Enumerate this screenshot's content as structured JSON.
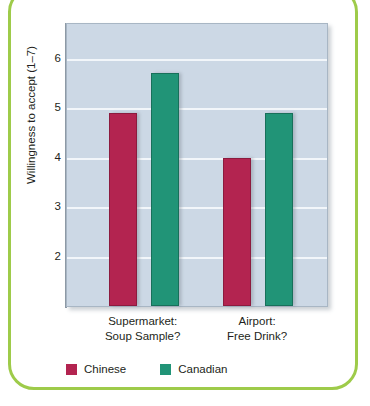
{
  "figure": {
    "frame_color": "#9ecb4a",
    "plot_background": "#ccd8e5",
    "gridline_color": "#f2f6fa"
  },
  "chart_data": {
    "type": "bar",
    "title": "",
    "xlabel": "",
    "ylabel": "Willingness to accept (1–7)",
    "categories": [
      "Supermarket:\nSoup Sample?",
      "Airport:\nFree Drink?"
    ],
    "category_lines": [
      [
        "Supermarket:",
        "Soup Sample?"
      ],
      [
        "Airport:",
        "Free Drink?"
      ]
    ],
    "series": [
      {
        "name": "Chinese",
        "color": "#b32450",
        "values": [
          4.9,
          4.0
        ]
      },
      {
        "name": "Canadian",
        "color": "#219477",
        "values": [
          5.7,
          4.9
        ]
      }
    ],
    "ylim": [
      1,
      6.7
    ],
    "yticks": [
      2,
      3,
      4,
      5,
      6
    ],
    "ytick_labels": [
      "2",
      "3",
      "4",
      "5",
      "6"
    ],
    "grid": true,
    "legend_position": "bottom-left"
  },
  "legend": {
    "entries": [
      {
        "label": "Chinese",
        "color": "#b32450"
      },
      {
        "label": "Canadian",
        "color": "#219477"
      }
    ]
  }
}
